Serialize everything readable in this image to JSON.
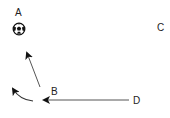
{
  "diagram": {
    "title": "",
    "colors": {
      "background": "#ffffff",
      "stroke": "#222222",
      "text": "#222222",
      "line": "#555555"
    },
    "nodes": [
      {
        "id": "A",
        "label": "A",
        "x": 19,
        "y": 13
      },
      {
        "id": "B",
        "label": "B",
        "x": 55,
        "y": 92
      },
      {
        "id": "C",
        "label": "C",
        "x": 160,
        "y": 28
      },
      {
        "id": "D",
        "label": "D",
        "x": 138,
        "y": 101
      }
    ],
    "objects": [
      {
        "type": "soccer-ball",
        "at": "A",
        "x": 19,
        "y": 29,
        "r": 6
      }
    ],
    "edges": [
      {
        "from": "D",
        "to": "B",
        "style": "straight-arrow",
        "description": "pass from D toward B"
      },
      {
        "from": "B",
        "to": "A",
        "style": "straight-arrow",
        "description": "move from B toward A"
      },
      {
        "from": "B",
        "to": "left",
        "style": "curved-arrow",
        "description": "curved run from B toward left"
      }
    ]
  }
}
